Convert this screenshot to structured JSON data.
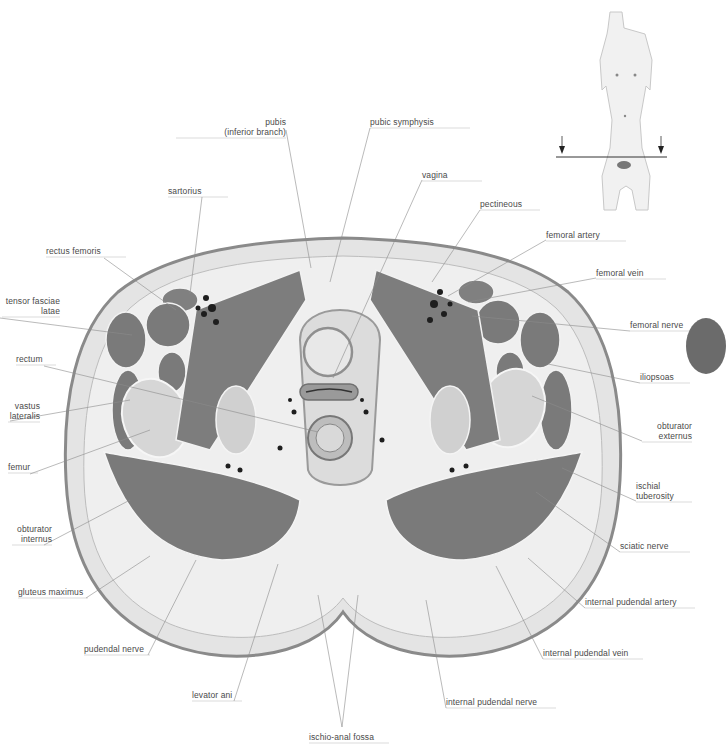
{
  "figure": {
    "orientation_figure": {
      "description": "female torso reference figure with section plane",
      "arrows": [
        "down-arrow-left",
        "down-arrow-right"
      ]
    }
  },
  "labels": {
    "pubis": {
      "lines": [
        "pubis",
        "(inferior branch)"
      ],
      "x": 176,
      "y": 117,
      "w": 110,
      "align": "r",
      "line": [
        [
          286,
          130
        ],
        [
          311,
          268
        ]
      ]
    },
    "pubic_symphysis": {
      "lines": [
        "pubic symphysis"
      ],
      "x": 370,
      "y": 117,
      "w": 100,
      "align": "l",
      "line": [
        [
          370,
          128
        ],
        [
          330,
          282
        ]
      ]
    },
    "vagina": {
      "lines": [
        "vagina"
      ],
      "x": 422,
      "y": 170,
      "w": 60,
      "align": "l",
      "line": [
        [
          422,
          180
        ],
        [
          333,
          378
        ]
      ]
    },
    "sartorius": {
      "lines": [
        "sartorius"
      ],
      "x": 168,
      "y": 186,
      "w": 60,
      "align": "l",
      "line": [
        [
          202,
          197
        ],
        [
          190,
          294
        ]
      ]
    },
    "pectineous": {
      "lines": [
        "pectineous"
      ],
      "x": 480,
      "y": 199,
      "w": 60,
      "align": "l",
      "line": [
        [
          480,
          210
        ],
        [
          432,
          282
        ]
      ]
    },
    "femoral_artery": {
      "lines": [
        "femoral artery"
      ],
      "x": 546,
      "y": 230,
      "w": 80,
      "align": "l",
      "line": [
        [
          546,
          240
        ],
        [
          448,
          296
        ]
      ]
    },
    "rectus_femoris": {
      "lines": [
        "rectus femoris"
      ],
      "x": 46,
      "y": 246,
      "w": 80,
      "align": "l",
      "line": [
        [
          104,
          258
        ],
        [
          176,
          310
        ]
      ]
    },
    "femoral_vein": {
      "lines": [
        "femoral vein"
      ],
      "x": 596,
      "y": 268,
      "w": 70,
      "align": "l",
      "line": [
        [
          596,
          278
        ],
        [
          468,
          302
        ]
      ]
    },
    "tensor_fasciae_latae": {
      "lines": [
        "tensor fasciae",
        "latae"
      ],
      "x": 2,
      "y": 296,
      "w": 58,
      "align": "r",
      "line": [
        [
          0,
          318
        ],
        [
          132,
          335
        ]
      ]
    },
    "femoral_nerve": {
      "lines": [
        "femoral nerve"
      ],
      "x": 630,
      "y": 320,
      "w": 66,
      "align": "l",
      "line": [
        [
          630,
          331
        ],
        [
          472,
          316
        ]
      ]
    },
    "rectum": {
      "lines": [
        "rectum"
      ],
      "x": 16,
      "y": 354,
      "w": 40,
      "align": "l",
      "line": [
        [
          44,
          366
        ],
        [
          318,
          432
        ]
      ]
    },
    "iliopsoas": {
      "lines": [
        "iliopsoas"
      ],
      "x": 640,
      "y": 372,
      "w": 50,
      "align": "l",
      "line": [
        [
          640,
          383
        ],
        [
          548,
          364
        ]
      ]
    },
    "vastus_lateralis": {
      "lines": [
        "vastus",
        "lateralis"
      ],
      "x": 8,
      "y": 401,
      "w": 32,
      "align": "r",
      "line": [
        [
          10,
          421
        ],
        [
          130,
          400
        ]
      ]
    },
    "obturator_externus": {
      "lines": [
        "obturator",
        "externus"
      ],
      "x": 642,
      "y": 421,
      "w": 50,
      "align": "r",
      "line": [
        [
          642,
          441
        ],
        [
          532,
          396
        ]
      ]
    },
    "femur": {
      "lines": [
        "femur"
      ],
      "x": 8,
      "y": 462,
      "w": 30,
      "align": "l",
      "line": [
        [
          30,
          474
        ],
        [
          150,
          430
        ]
      ]
    },
    "ischial_tuberosity": {
      "lines": [
        "ischial",
        "tuberosity"
      ],
      "x": 636,
      "y": 481,
      "w": 56,
      "align": "l",
      "line": [
        [
          636,
          501
        ],
        [
          562,
          468
        ]
      ]
    },
    "obturator_internus": {
      "lines": [
        "obturator",
        "internus"
      ],
      "x": 12,
      "y": 524,
      "w": 40,
      "align": "r",
      "line": [
        [
          44,
          545
        ],
        [
          130,
          500
        ]
      ]
    },
    "sciatic_nerve": {
      "lines": [
        "sciatic nerve"
      ],
      "x": 620,
      "y": 541,
      "w": 70,
      "align": "l",
      "line": [
        [
          620,
          552
        ],
        [
          536,
          492
        ]
      ]
    },
    "gluteus_maximus": {
      "lines": [
        "gluteus maximus"
      ],
      "x": 18,
      "y": 587,
      "w": 70,
      "align": "l",
      "line": [
        [
          86,
          598
        ],
        [
          150,
          556
        ]
      ]
    },
    "internal_pudendal_artery": {
      "lines": [
        "internal pudendal artery"
      ],
      "x": 585,
      "y": 597,
      "w": 110,
      "align": "l",
      "line": [
        [
          585,
          608
        ],
        [
          528,
          558
        ]
      ]
    },
    "pudendal_nerve": {
      "lines": [
        "pudendal nerve"
      ],
      "x": 84,
      "y": 644,
      "w": 66,
      "align": "l",
      "line": [
        [
          148,
          655
        ],
        [
          196,
          560
        ]
      ]
    },
    "internal_pudendal_vein": {
      "lines": [
        "internal pudendal vein"
      ],
      "x": 543,
      "y": 648,
      "w": 100,
      "align": "l",
      "line": [
        [
          543,
          659
        ],
        [
          496,
          566
        ]
      ]
    },
    "levator_ani": {
      "lines": [
        "levator ani"
      ],
      "x": 192,
      "y": 690,
      "w": 50,
      "align": "l",
      "line": [
        [
          234,
          701
        ],
        [
          278,
          564
        ]
      ]
    },
    "internal_pudendal_nerve": {
      "lines": [
        "internal pudendal nerve"
      ],
      "x": 446,
      "y": 697,
      "w": 110,
      "align": "l",
      "line": [
        [
          446,
          708
        ],
        [
          426,
          600
        ]
      ]
    },
    "ischio_anal_fossa": {
      "lines": [
        "ischio-anal fossa"
      ],
      "x": 309,
      "y": 732,
      "w": 80,
      "align": "l",
      "line": [
        [
          342,
          727
        ],
        [
          318,
          595
        ]
      ],
      "line2": [
        [
          342,
          727
        ],
        [
          358,
          595
        ]
      ]
    }
  },
  "colors": {
    "background": "#ffffff",
    "skin_outline": "#8a8a8a",
    "fat": "#e6e6e6",
    "muscle": "#7a7a7a",
    "bone": "#d8d8d8",
    "vessel": "#222222",
    "label_text": "#4a4a4a",
    "leader_line": "#8c8c8c",
    "side_tab": "#6b6b6b"
  }
}
